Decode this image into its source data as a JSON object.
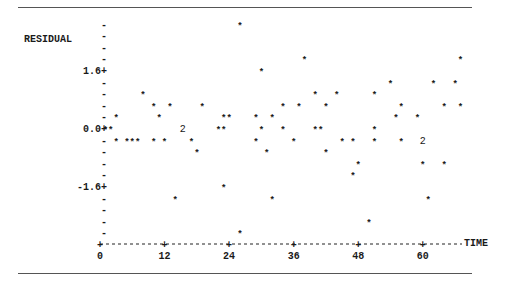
{
  "chart_data": {
    "type": "scatter",
    "title": "",
    "xlabel": "TIME",
    "ylabel": "RESIDUAL",
    "xlim": [
      0,
      68
    ],
    "ylim": [
      -2.88,
      2.88
    ],
    "y_step": 0.32,
    "x_ticks": [
      0,
      12,
      24,
      36,
      48,
      60
    ],
    "x_tick_labels": [
      "0",
      "12",
      "24",
      "36",
      "48",
      "60"
    ],
    "y_ticks": [
      1.6,
      0.0,
      -1.6
    ],
    "y_tick_labels": [
      "1.6+",
      "0.0+",
      "-1.6+"
    ],
    "grid": false,
    "legend": "none",
    "marker": "*",
    "multi_marker_note": "digit '2' marks two coincident observations",
    "points": [
      {
        "t": 1,
        "r": 0.0
      },
      {
        "t": 2,
        "r": 0.0
      },
      {
        "t": 3,
        "r": 0.32
      },
      {
        "t": 3,
        "r": -0.32
      },
      {
        "t": 5,
        "r": -0.32
      },
      {
        "t": 6,
        "r": -0.32
      },
      {
        "t": 7,
        "r": -0.32
      },
      {
        "t": 8,
        "r": 0.96
      },
      {
        "t": 10,
        "r": 0.64
      },
      {
        "t": 10,
        "r": -0.32
      },
      {
        "t": 11,
        "r": 0.32
      },
      {
        "t": 12,
        "r": -0.32
      },
      {
        "t": 13,
        "r": 0.64
      },
      {
        "t": 14,
        "r": -1.92
      },
      {
        "t": 15.4,
        "r": 0.0,
        "n": 2
      },
      {
        "t": 17,
        "r": -0.32
      },
      {
        "t": 18,
        "r": -0.64
      },
      {
        "t": 19,
        "r": 0.64
      },
      {
        "t": 22,
        "r": 0.0
      },
      {
        "t": 23,
        "r": 0.0
      },
      {
        "t": 23,
        "r": 0.32
      },
      {
        "t": 24,
        "r": 0.32
      },
      {
        "t": 23,
        "r": -1.6
      },
      {
        "t": 26,
        "r": 2.88
      },
      {
        "t": 26,
        "r": -2.88
      },
      {
        "t": 29,
        "r": 0.32
      },
      {
        "t": 29,
        "r": -0.32
      },
      {
        "t": 30,
        "r": 1.6
      },
      {
        "t": 30,
        "r": 0.0
      },
      {
        "t": 31,
        "r": -0.64
      },
      {
        "t": 32,
        "r": 0.32
      },
      {
        "t": 32,
        "r": -1.92
      },
      {
        "t": 34,
        "r": 0.64
      },
      {
        "t": 34,
        "r": 0.0
      },
      {
        "t": 36,
        "r": -0.32
      },
      {
        "t": 37,
        "r": 0.64
      },
      {
        "t": 38,
        "r": 1.92
      },
      {
        "t": 40,
        "r": 0.96
      },
      {
        "t": 40,
        "r": 0.0
      },
      {
        "t": 41,
        "r": 0.0
      },
      {
        "t": 42,
        "r": 0.64
      },
      {
        "t": 42,
        "r": -0.64
      },
      {
        "t": 44,
        "r": 0.96
      },
      {
        "t": 45,
        "r": -0.32
      },
      {
        "t": 47,
        "r": -0.32
      },
      {
        "t": 47,
        "r": -1.28
      },
      {
        "t": 48,
        "r": -0.96
      },
      {
        "t": 50,
        "r": -2.56
      },
      {
        "t": 51,
        "r": 0.96
      },
      {
        "t": 51,
        "r": 0.0
      },
      {
        "t": 51,
        "r": -0.32
      },
      {
        "t": 54,
        "r": 1.28
      },
      {
        "t": 55,
        "r": 0.32
      },
      {
        "t": 56,
        "r": 0.64
      },
      {
        "t": 56,
        "r": -0.32
      },
      {
        "t": 59,
        "r": 0.32
      },
      {
        "t": 60,
        "r": -0.32,
        "n": 2
      },
      {
        "t": 60,
        "r": -0.96
      },
      {
        "t": 61,
        "r": -1.92
      },
      {
        "t": 62,
        "r": 1.28
      },
      {
        "t": 64,
        "r": -0.96
      },
      {
        "t": 64,
        "r": 0.64
      },
      {
        "t": 66,
        "r": 1.28
      },
      {
        "t": 67,
        "r": 0.64
      },
      {
        "t": 67,
        "r": 1.92
      }
    ]
  }
}
